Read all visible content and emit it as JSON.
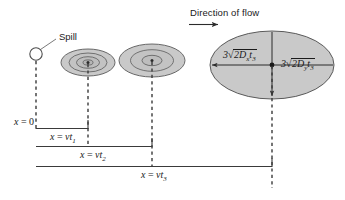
{
  "figure": {
    "title_flow": "Direction of flow",
    "spill_label": "Spill",
    "plumes": [
      {
        "name": "plume-t1"
      },
      {
        "name": "plume-t2"
      },
      {
        "name": "plume-t3"
      }
    ],
    "ellipse_labels": {
      "horizontal": {
        "coefficient": "3",
        "radical_sign": "√",
        "radicand": "2D",
        "radicand_sub": "x",
        "radicand_t": "t",
        "radicand_t_sub": "3",
        "full_text": "3√(2Dx t3)"
      },
      "vertical": {
        "coefficient": "3",
        "radical_sign": "√",
        "radicand": "2D",
        "radicand_sub": "y",
        "radicand_t": "t",
        "radicand_t_sub": "3",
        "full_text": "3√(2Dy t3)"
      }
    },
    "axis_labels": [
      {
        "name": "x-origin",
        "prefix": "x",
        "eq": " = ",
        "value": "0",
        "sub": ""
      },
      {
        "name": "x-vt1",
        "prefix": "x",
        "eq": " = ",
        "value": "vt",
        "sub": "1"
      },
      {
        "name": "x-vt2",
        "prefix": "x",
        "eq": " = ",
        "value": "vt",
        "sub": "2"
      },
      {
        "name": "x-vt3",
        "prefix": "x",
        "eq": " = ",
        "value": "vt",
        "sub": "3"
      }
    ],
    "colors": {
      "fill_outer": "#c9c9c9",
      "fill_mid": "#c3c3c3",
      "fill_inner": "#bdbdbd",
      "stroke": "#4d4d4d",
      "line": "#3a3a3a",
      "text": "#1a1a1a"
    }
  }
}
